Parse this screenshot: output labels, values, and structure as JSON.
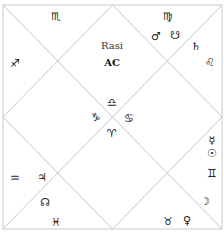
{
  "chart": {
    "title": "Rasi",
    "subtitle": "AC",
    "line_color": "#c8c8c8",
    "glyph_color": "#1a1a1a"
  },
  "houses": [
    {
      "house": 1,
      "position": "top-center",
      "sign": "♎",
      "sign_name": "Libra",
      "planets": []
    },
    {
      "house": 2,
      "position": "top-left",
      "sign": "♏",
      "sign_name": "Scorpio",
      "planets": []
    },
    {
      "house": 3,
      "position": "left-top",
      "sign": "♐",
      "sign_name": "Sagittarius",
      "planets": []
    },
    {
      "house": 4,
      "position": "left-center",
      "sign": "♑",
      "sign_name": "Capricorn",
      "planets": []
    },
    {
      "house": 5,
      "position": "left-bottom",
      "sign": "♒",
      "sign_name": "Aquarius",
      "planets": [
        "♃"
      ]
    },
    {
      "house": 6,
      "position": "bottom-left",
      "sign": "♓",
      "sign_name": "Pisces",
      "planets": [
        "☊"
      ]
    },
    {
      "house": 7,
      "position": "bottom-center",
      "sign": "♈",
      "sign_name": "Aries",
      "planets": []
    },
    {
      "house": 8,
      "position": "bottom-right",
      "sign": "♉",
      "sign_name": "Taurus",
      "planets": [
        "♀"
      ]
    },
    {
      "house": 9,
      "position": "right-bottom",
      "sign": "♊",
      "sign_name": "Gemini",
      "planets": [
        "☿",
        "☉",
        "☽"
      ]
    },
    {
      "house": 10,
      "position": "right-center",
      "sign": "♋",
      "sign_name": "Cancer",
      "planets": []
    },
    {
      "house": 11,
      "position": "right-top",
      "sign": "♌",
      "sign_name": "Leo",
      "planets": [
        "♄"
      ]
    },
    {
      "house": 12,
      "position": "top-right",
      "sign": "♍",
      "sign_name": "Virgo",
      "planets": [
        "♂",
        "☋"
      ]
    }
  ],
  "labels": {
    "h1_sign": "♎",
    "h2_sign": "♏",
    "h3_sign": "♐",
    "h4_sign": "♑",
    "h5_sign": "♒",
    "h5_p1": "♃",
    "h6_sign": "♓",
    "h6_p1": "☊",
    "h7_sign": "♈",
    "h8_sign": "♉",
    "h8_p1": "♀",
    "h9_sign": "♊",
    "h9_p1": "☿",
    "h9_p2": "☉",
    "h9_p3": "☽",
    "h10_sign": "♋",
    "h11_sign": "♌",
    "h11_p1": "♄",
    "h12_sign": "♍",
    "h12_p1": "♂",
    "h12_p2": "☋"
  }
}
